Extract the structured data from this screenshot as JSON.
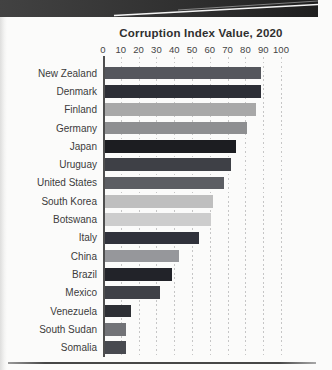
{
  "banner": {
    "bg_left": "#424242",
    "bg_mid": "#2f2f2f",
    "bg_right": "#1f1f1f",
    "swoosh_line_color": "#f5f5f5"
  },
  "chart_data": {
    "type": "bar",
    "orientation": "horizontal",
    "title": "Corruption Index Value, 2020",
    "xlabel": "",
    "ylabel": "",
    "xlim": [
      0,
      100
    ],
    "x_ticks": [
      0,
      10,
      20,
      30,
      40,
      50,
      60,
      70,
      80,
      90,
      100
    ],
    "grid": "dotted vertical gridlines at every 10 units",
    "legend": "none",
    "categories": [
      "New Zealand",
      "Denmark",
      "Finland",
      "Germany",
      "Japan",
      "Uruguay",
      "United States",
      "South Korea",
      "Botswana",
      "Italy",
      "China",
      "Brazil",
      "Mexico",
      "Venezuela",
      "South Sudan",
      "Somalia"
    ],
    "values": [
      88,
      88,
      85,
      80,
      74,
      71,
      67,
      61,
      60,
      53,
      42,
      38,
      31,
      15,
      12,
      12
    ],
    "bar_colors": [
      "#55575d",
      "#2c2e35",
      "#a8a8a8",
      "#8e8f91",
      "#1c1d21",
      "#3e4046",
      "#5c5e63",
      "#bfbfbf",
      "#cdcdcd",
      "#30323b",
      "#96979b",
      "#222329",
      "#3f4147",
      "#2d2f34",
      "#727377",
      "#484a50"
    ],
    "axis_color": "#4f4f4f",
    "gridline_color": "#c6c6c6"
  }
}
